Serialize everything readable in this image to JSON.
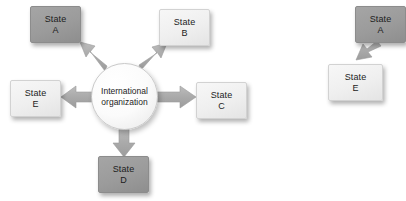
{
  "figure": {
    "background_color": "#ffffff",
    "node_light_color": "#efefef",
    "node_dark_color": "#9b9b9b",
    "arrow_color": "#a8a8a8",
    "text_color": "#1c1c1c"
  },
  "diagram_left": {
    "hub": {
      "line1": "International",
      "line2": "organization",
      "shape": "circle"
    },
    "nodes": [
      {
        "id": "a",
        "line1": "State",
        "line2": "A",
        "shade": "dark"
      },
      {
        "id": "b",
        "line1": "State",
        "line2": "B",
        "shade": "light"
      },
      {
        "id": "c",
        "line1": "State",
        "line2": "C",
        "shade": "light"
      },
      {
        "id": "d",
        "line1": "State",
        "line2": "D",
        "shade": "dark"
      },
      {
        "id": "e",
        "line1": "State",
        "line2": "E",
        "shade": "light"
      }
    ],
    "arrows": [
      {
        "from": "hub",
        "to": "a",
        "direction": "up-left"
      },
      {
        "from": "hub",
        "to": "b",
        "direction": "up-right"
      },
      {
        "from": "hub",
        "to": "c",
        "direction": "right"
      },
      {
        "from": "hub",
        "to": "d",
        "direction": "down"
      },
      {
        "from": "hub",
        "to": "e",
        "direction": "left"
      }
    ]
  },
  "diagram_right": {
    "nodes": [
      {
        "id": "a2",
        "line1": "State",
        "line2": "A",
        "shade": "dark",
        "clipped": "true"
      },
      {
        "id": "e2",
        "line1": "State",
        "line2": "E",
        "shade": "light"
      }
    ],
    "arrows": [
      {
        "from": "a2",
        "to": "e2",
        "direction": "down-left"
      }
    ]
  }
}
